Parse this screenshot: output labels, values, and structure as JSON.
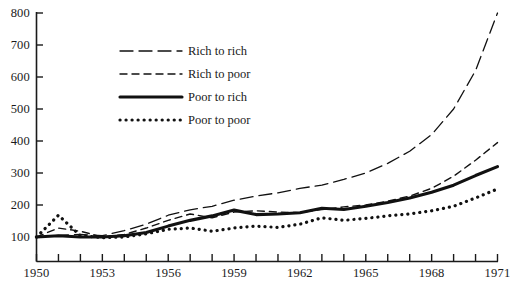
{
  "chart_data": {
    "type": "line",
    "title": "",
    "subtitle": "",
    "xlabel": "",
    "ylabel": "",
    "xlim": [
      1950,
      1971
    ],
    "ylim": [
      100,
      800
    ],
    "grid": false,
    "legend_position": "upper-left-inside",
    "y_ticks": [
      800,
      700,
      600,
      500,
      400,
      300,
      200,
      100
    ],
    "y_tick_labels": [
      "800",
      "700",
      "600",
      "500",
      "400",
      "300",
      "200",
      "100"
    ],
    "x_ticks": [
      1950,
      1951,
      1952,
      1953,
      1954,
      1955,
      1956,
      1957,
      1958,
      1959,
      1960,
      1961,
      1962,
      1963,
      1964,
      1965,
      1966,
      1967,
      1968,
      1969,
      1970,
      1971
    ],
    "x_tick_labels_shown": [
      "1950",
      "1953",
      "1956",
      "1959",
      "1962",
      "1965",
      "1968",
      "1971"
    ],
    "x_tick_label_years": [
      1950,
      1953,
      1956,
      1959,
      1962,
      1965,
      1968,
      1971
    ],
    "x": [
      1950,
      1951,
      1952,
      1953,
      1954,
      1955,
      1956,
      1957,
      1958,
      1959,
      1960,
      1961,
      1962,
      1963,
      1964,
      1965,
      1966,
      1967,
      1968,
      1969,
      1970,
      1971
    ],
    "series": [
      {
        "name": "Rich to rich",
        "style": "long-dash",
        "color": "#111111",
        "width": 1.3,
        "values": [
          100,
          105,
          108,
          104,
          120,
          140,
          168,
          185,
          196,
          215,
          228,
          238,
          252,
          262,
          280,
          300,
          330,
          368,
          420,
          500,
          620,
          800
        ]
      },
      {
        "name": "Rich to poor",
        "style": "short-dash",
        "color": "#111111",
        "width": 1.4,
        "values": [
          100,
          128,
          118,
          100,
          108,
          128,
          152,
          172,
          160,
          178,
          182,
          178,
          176,
          186,
          194,
          200,
          212,
          228,
          252,
          290,
          340,
          395
        ]
      },
      {
        "name": "Poor to rich",
        "style": "solid",
        "color": "#111111",
        "width": 3.1,
        "values": [
          100,
          104,
          100,
          100,
          104,
          114,
          134,
          152,
          166,
          184,
          170,
          172,
          176,
          190,
          186,
          196,
          208,
          222,
          240,
          262,
          292,
          320
        ]
      },
      {
        "name": "Poor to poor",
        "style": "dotted",
        "color": "#111111",
        "width": 3.2,
        "values": [
          100,
          168,
          104,
          98,
          100,
          110,
          124,
          128,
          118,
          128,
          134,
          130,
          140,
          160,
          152,
          158,
          166,
          172,
          182,
          196,
          222,
          250
        ]
      }
    ],
    "legend": [
      {
        "label": "Rich to rich",
        "style": "long-dash"
      },
      {
        "label": "Rich to poor",
        "style": "short-dash"
      },
      {
        "label": "Poor to rich",
        "style": "solid"
      },
      {
        "label": "Poor to poor",
        "style": "dotted"
      }
    ],
    "axis_color": "#1a1a1a"
  }
}
